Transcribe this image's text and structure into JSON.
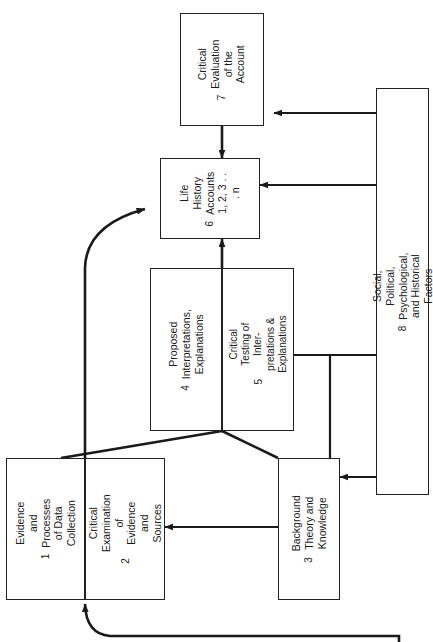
{
  "diagram": {
    "orientation": "rotated-90-ccw",
    "nodes": [
      {
        "id": "n1",
        "number": "1",
        "label": "Evidence and Processes\nof Data Collection"
      },
      {
        "id": "n2",
        "number": "2",
        "label": "Critical Examination of\nEvidence and Sources"
      },
      {
        "id": "n3",
        "number": "3",
        "label": "Background Theory and\nKnowledge"
      },
      {
        "id": "n4",
        "number": "4",
        "label": "Proposed Interpretations,\nExplanations"
      },
      {
        "id": "n5",
        "number": "5",
        "label": "Critical Testing of Inter-\npretations & Explanations"
      },
      {
        "id": "n6",
        "number": "6",
        "label": "Life History\nAccounts\n1, 2, 3 . . . n"
      },
      {
        "id": "n7",
        "number": "7",
        "label": "Critical Evaluation\nof the Account"
      },
      {
        "id": "n8",
        "number": "8",
        "label": "Social, Political, Psychological, and Historical Factors"
      }
    ],
    "edges": [
      {
        "from": "n7",
        "to": "n6",
        "kind": "arrow-down"
      },
      {
        "from": "n4n5",
        "to": "n6",
        "kind": "arrow-up"
      },
      {
        "from": "n1n2",
        "to": "n6",
        "kind": "curved-arrow"
      },
      {
        "from": "n8",
        "to": "n7",
        "kind": "arrow-left"
      },
      {
        "from": "n8",
        "to": "n6",
        "kind": "arrow-left"
      },
      {
        "from": "n8",
        "to": "n5",
        "kind": "arrow-left"
      },
      {
        "from": "n8",
        "to": "n3",
        "kind": "arrow-left"
      },
      {
        "from": "n3",
        "to": "n2",
        "kind": "arrow-left"
      },
      {
        "from": "n2",
        "to": "n4n5",
        "kind": "diagonal"
      },
      {
        "from": "n3",
        "to": "n4n5",
        "kind": "diagonal"
      },
      {
        "from": "n8",
        "to": "n1n2",
        "kind": "long-curved-arrow"
      }
    ],
    "colors": {
      "line": "#1a1a1a",
      "box_border": "#222222",
      "background": "#ffffff"
    }
  }
}
